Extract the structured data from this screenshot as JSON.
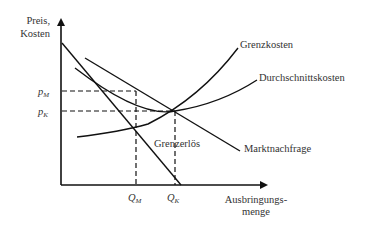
{
  "diagram": {
    "type": "economics-monopoly-vs-competition",
    "y_axis": {
      "label_line1": "Preis,",
      "label_line2": "Kosten"
    },
    "x_axis": {
      "label_line1": "Ausbringungs-",
      "label_line2": "menge"
    },
    "y_ticks": [
      {
        "symbol": "p",
        "subscript": "M"
      },
      {
        "symbol": "p",
        "subscript": "K"
      }
    ],
    "x_ticks": [
      {
        "symbol": "Q",
        "subscript": "M"
      },
      {
        "symbol": "Q",
        "subscript": "K"
      }
    ],
    "curves": {
      "marginal_cost": "Grenzkosten",
      "average_cost": "Durchschnittskosten",
      "marginal_revenue": "Grenzerlös",
      "demand": "Marktnachfrage"
    },
    "colors": {
      "line": "#111111",
      "text": "#333333"
    }
  }
}
